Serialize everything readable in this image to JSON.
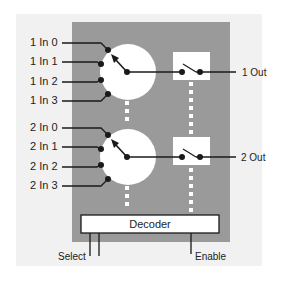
{
  "diagram": {
    "colors": {
      "background": "#ffffff",
      "panel": "#f1f1f1",
      "block": "#9a9a9a",
      "white": "#ffffff",
      "line": "#1a1a1a"
    },
    "mux1": {
      "inputs": [
        "1 In 0",
        "1 In 1",
        "1 In 2",
        "1 In 3"
      ],
      "output": "1 Out"
    },
    "mux2": {
      "inputs": [
        "2 In 0",
        "2 In 1",
        "2 In 2",
        "2 In 3"
      ],
      "output": "2 Out"
    },
    "decoder": {
      "label": "Decoder"
    },
    "controls": {
      "select": "Select",
      "enable": "Enable"
    }
  }
}
